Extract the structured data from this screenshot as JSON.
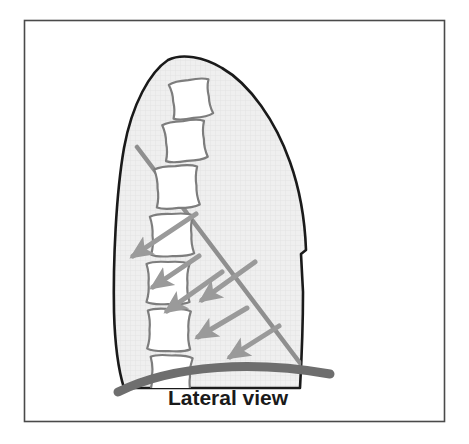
{
  "figure": {
    "name": "thoracic-spine-lateral-view-diagram",
    "caption": "Lateral view",
    "background_color": "#ffffff",
    "frame": {
      "name": "figure-border",
      "color": "#4a4a4a",
      "x": 24,
      "y": 20,
      "width": 421,
      "height": 402
    },
    "body_outline": {
      "name": "thorax-silhouette",
      "stroke_color": "#1a1a1a",
      "fill_color": "#efefef",
      "stroke_width": 2.6,
      "notch_label": "posterior-notch"
    },
    "texture": {
      "name": "hatch-texture",
      "color": "#e2e2e2"
    },
    "vertebrae": {
      "count": 7,
      "fill_color": "#ffffff",
      "stroke_color": "#7d7d7d",
      "items": [
        {
          "label": "vertebra-1",
          "cx": 191,
          "cy": 99,
          "w": 40,
          "h": 35,
          "rot": -8
        },
        {
          "label": "vertebra-2",
          "cx": 185,
          "cy": 141,
          "w": 42,
          "h": 37,
          "rot": -6
        },
        {
          "label": "vertebra-3",
          "cx": 177,
          "cy": 187,
          "w": 43,
          "h": 38,
          "rot": -4
        },
        {
          "label": "vertebra-4",
          "cx": 172,
          "cy": 235,
          "w": 43,
          "h": 38,
          "rot": -2
        },
        {
          "label": "vertebra-5",
          "cx": 168,
          "cy": 283,
          "w": 43,
          "h": 38,
          "rot": 0
        },
        {
          "label": "vertebra-6",
          "cx": 169,
          "cy": 330,
          "w": 43,
          "h": 38,
          "rot": 1
        },
        {
          "label": "vertebra-7",
          "cx": 171,
          "cy": 376,
          "w": 42,
          "h": 37,
          "rot": 2
        }
      ]
    },
    "diagonal_line": {
      "name": "oblique-reference-line",
      "color": "#8f8f8f",
      "width": 4.5,
      "x1": 137,
      "y1": 147,
      "x2": 306,
      "y2": 371
    },
    "arrows": {
      "name": "force-direction-arrows",
      "color": "#9a9a9a",
      "width": 5,
      "items": [
        {
          "label": "arrow-1",
          "x1": 196,
          "y1": 214,
          "x2": 131,
          "y2": 258
        },
        {
          "label": "arrow-2",
          "x1": 199,
          "y1": 256,
          "x2": 151,
          "y2": 288
        },
        {
          "label": "arrow-3",
          "x1": 222,
          "y1": 272,
          "x2": 165,
          "y2": 312
        },
        {
          "label": "arrow-4",
          "x1": 255,
          "y1": 262,
          "x2": 200,
          "y2": 301
        },
        {
          "label": "arrow-5",
          "x1": 247,
          "y1": 308,
          "x2": 196,
          "y2": 338
        },
        {
          "label": "arrow-6",
          "x1": 279,
          "y1": 326,
          "x2": 228,
          "y2": 358
        }
      ]
    },
    "diaphragm": {
      "name": "diaphragm-band",
      "color": "#6e6e6e",
      "thickness": 9
    }
  }
}
